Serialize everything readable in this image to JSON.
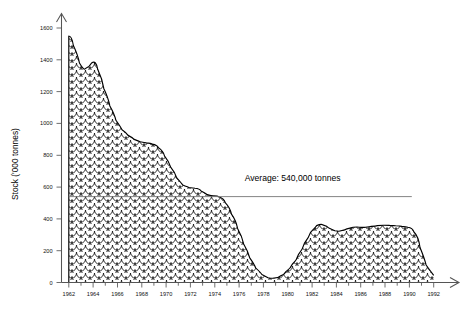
{
  "chart_data": {
    "type": "area",
    "title": "",
    "xlabel": "",
    "ylabel": "Stock ('000 tonnes)",
    "xlim": [
      1961.4,
      1992.6
    ],
    "ylim": [
      0,
      1700
    ],
    "yticks": [
      0,
      200,
      400,
      600,
      800,
      1000,
      1200,
      1400,
      1600
    ],
    "ytick_labels": [
      "0",
      "200",
      "400",
      "600",
      "800",
      "1000",
      "1200",
      "1400",
      "1600"
    ],
    "xticks": [
      1962,
      1964,
      1966,
      1968,
      1970,
      1972,
      1974,
      1976,
      1978,
      1980,
      1982,
      1984,
      1986,
      1988,
      1990,
      1992
    ],
    "xtick_labels": [
      "1962",
      "1964",
      "1966",
      "1968",
      "1970",
      "1972",
      "1974",
      "1976",
      "1978",
      "1980",
      "1982",
      "1984",
      "1986",
      "1988",
      "1990",
      "1992"
    ],
    "xminor_step": 1,
    "grid": false,
    "legend": null,
    "fill_pattern": "fish-scale",
    "series": [
      {
        "name": "Stock",
        "x": [
          1962,
          1962.5,
          1963,
          1963.5,
          1964,
          1964.5,
          1965,
          1965.5,
          1966,
          1966.5,
          1967,
          1967.5,
          1968,
          1968.5,
          1969,
          1969.5,
          1970,
          1970.5,
          1971,
          1971.5,
          1972,
          1972.5,
          1973,
          1973.5,
          1974,
          1974.5,
          1975,
          1975.5,
          1976,
          1976.5,
          1977,
          1977.5,
          1978,
          1978.5,
          1979,
          1979.5,
          1980,
          1980.5,
          1981,
          1981.5,
          1982,
          1982.5,
          1983,
          1983.5,
          1984,
          1984.5,
          1985,
          1985.5,
          1986,
          1986.5,
          1987,
          1987.5,
          1988,
          1988.5,
          1989,
          1989.5,
          1990,
          1990.5,
          1991,
          1991.5,
          1992
        ],
        "values": [
          1550,
          1430,
          1330,
          1360,
          1400,
          1280,
          1160,
          1060,
          980,
          940,
          910,
          890,
          880,
          875,
          865,
          830,
          760,
          690,
          625,
          600,
          595,
          590,
          560,
          545,
          545,
          530,
          470,
          390,
          290,
          195,
          115,
          65,
          35,
          25,
          30,
          50,
          90,
          140,
          210,
          285,
          345,
          370,
          355,
          330,
          320,
          330,
          345,
          350,
          345,
          350,
          355,
          360,
          360,
          358,
          355,
          350,
          345,
          290,
          150,
          70,
          45
        ]
      }
    ],
    "annotations": [
      {
        "name": "average-line",
        "label": "Average: 540,000 tonnes",
        "value": 540,
        "x_start": 1962,
        "x_end": 1990.2,
        "label_x": 1980.4,
        "label_y": 640
      }
    ]
  },
  "axis": {
    "y_label": "Stock ('000 tonnes)",
    "y_arrow": "arrow-up",
    "x_arrow": "arrow-right"
  }
}
